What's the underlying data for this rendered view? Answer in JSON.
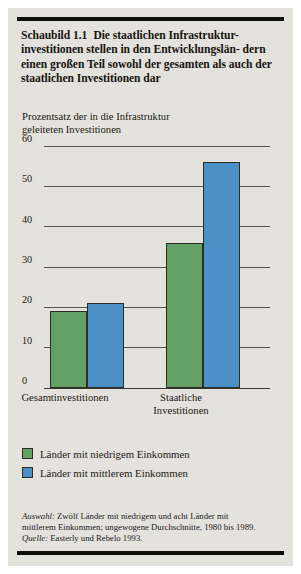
{
  "figure": {
    "number": "Schaubild 1.1",
    "title_line1": "Die staatlichen Infrastruktur-",
    "title_line2": "investitionen stellen in den Entwicklungslän-",
    "title_line3": "dern einen großen Teil sowohl der gesamten",
    "title_line4": "als auch der staatlichen Investitionen dar"
  },
  "axis_title": {
    "line1": "Prozentsatz der in die Infrastruktur",
    "line2": "geleiteten Investitionen"
  },
  "xlabels": {
    "cat1_line1": "Gesamtinvestitionen",
    "cat2_line1": "Staatliche",
    "cat2_line2": "Investitionen"
  },
  "legend": {
    "items": [
      {
        "label": "Länder mit niedrigem Einkommen",
        "color": "#63a063",
        "swatch": "green"
      },
      {
        "label": "Länder mit mittlerem Einkommen",
        "color": "#4b91c7",
        "swatch": "blue"
      }
    ]
  },
  "notes": {
    "source_label": "Auswahl:",
    "line1_rest": " Zwölf Länder mit niedrigem und acht Länder mit",
    "line2": "mittlerem Einkommen; ungewogene Durchschnitte, 1980 bis 1989.",
    "quelle_label": "Quelle:",
    "quelle_rest": " Easterly und Rebelo 1993.",
    "full": "Auswahl: Zwölf Länder mit niedrigem und acht Länder mit mittlerem Einkommen; ungewogene Durchschnitte, 1980 bis 1989. Quelle: Easterly und Rebelo 1993."
  },
  "colors": {
    "paper": "#e4e2dd",
    "rule": "#0d0d0b",
    "green": "#63a063",
    "blue": "#4b91c7",
    "grid": "#55554c",
    "text": "#1a190f"
  },
  "chart_data": {
    "type": "bar",
    "xlabel": "",
    "ylabel": "Prozentsatz der in die Infrastruktur geleiteten Investitionen",
    "categories": [
      "Gesamtinvestitionen",
      "Staatliche Investitionen"
    ],
    "series": [
      {
        "name": "Länder mit niedrigem Einkommen",
        "color": "#63a063",
        "values": [
          19,
          36
        ]
      },
      {
        "name": "Länder mit mittlerem Einkommen",
        "color": "#4b91c7",
        "values": [
          21,
          56
        ]
      }
    ],
    "ylim": [
      0,
      60
    ],
    "yticks": [
      0,
      10,
      20,
      30,
      40,
      50,
      60
    ],
    "ytick_labels": [
      "0",
      "10",
      "20",
      "30",
      "40",
      "50",
      "60"
    ],
    "grid": true,
    "grid_axis": "y",
    "legend_position": "below-plot",
    "notes": "Auswahl: Zwölf Länder mit niedrigem und acht Länder mit mittlerem Einkommen; ungewogene Durchschnitte, 1980 bis 1989. Quelle: Easterly und Rebelo 1993."
  }
}
